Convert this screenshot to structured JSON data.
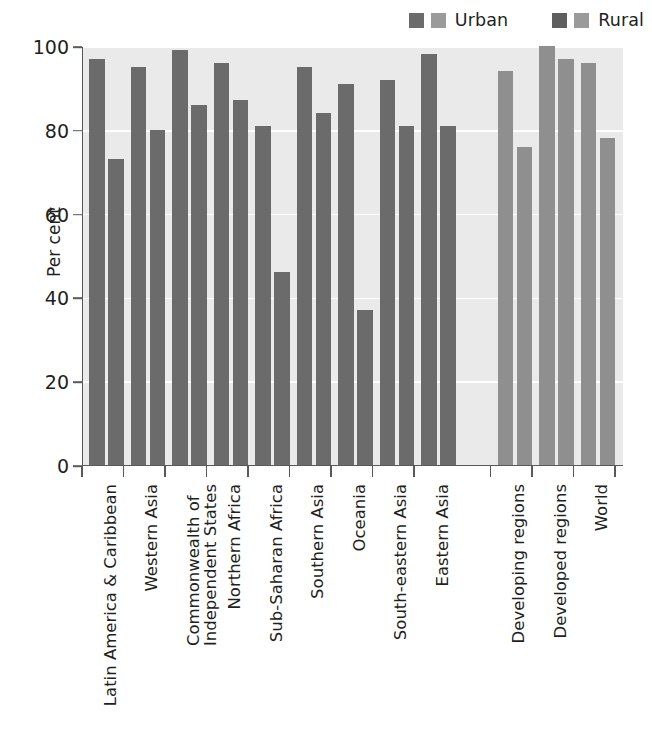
{
  "legend": {
    "entries": [
      {
        "label": "Urban",
        "dark_color": "#6b6b6b",
        "light_color": "#9a9a9a",
        "icon": "legend-swatch"
      },
      {
        "label": "Rural",
        "dark_color": "#5f5f5f",
        "light_color": "#9a9a9a",
        "icon": "legend-swatch"
      }
    ]
  },
  "colors": {
    "bar_dark": "#6b6b6b",
    "bar_light": "#8f8f8f",
    "plot_background": "#eaeaea",
    "gridline": "#ffffff",
    "axis": "#58595b",
    "text": "#231f20"
  },
  "chart_data": {
    "type": "bar",
    "title": "",
    "xlabel": "",
    "ylabel": "Per cent",
    "ylim": [
      0,
      100
    ],
    "yticks": [
      0,
      20,
      40,
      60,
      80,
      100
    ],
    "ytick_labels": [
      "0",
      "20",
      "40",
      "60",
      "80",
      "100"
    ],
    "grid": true,
    "legend_position": "top-right",
    "categories": [
      "Latin America & Caribbean",
      "Western Asia",
      "Commonwealth of Independent States",
      "Northern Africa",
      "Sub-Saharan Africa",
      "Southern Asia",
      "Oceania",
      "South-eastern Asia",
      "Eastern Asia",
      "Developing regions",
      "Developed regions",
      "World"
    ],
    "category_label_lines": [
      [
        "Latin America & Caribbean"
      ],
      [
        "Western Asia"
      ],
      [
        "Commonwealth of",
        "Independent States"
      ],
      [
        "Northern Africa"
      ],
      [
        "Sub-Saharan Africa"
      ],
      [
        "Southern Asia"
      ],
      [
        "Oceania"
      ],
      [
        "South-eastern Asia"
      ],
      [
        "Eastern Asia"
      ],
      [
        "Developing regions"
      ],
      [
        "Developed regions"
      ],
      [
        "World"
      ]
    ],
    "series": [
      {
        "name": "Urban",
        "values": [
          97,
          95,
          99,
          96,
          81,
          95,
          91,
          92,
          98,
          94,
          100,
          96
        ]
      },
      {
        "name": "Rural",
        "values": [
          73,
          80,
          86,
          87,
          46,
          84,
          37,
          81,
          81,
          76,
          97,
          78
        ]
      }
    ],
    "group_shading": [
      "dark",
      "dark",
      "dark",
      "dark",
      "dark",
      "dark",
      "dark",
      "dark",
      "dark",
      "light",
      "light",
      "light"
    ]
  }
}
